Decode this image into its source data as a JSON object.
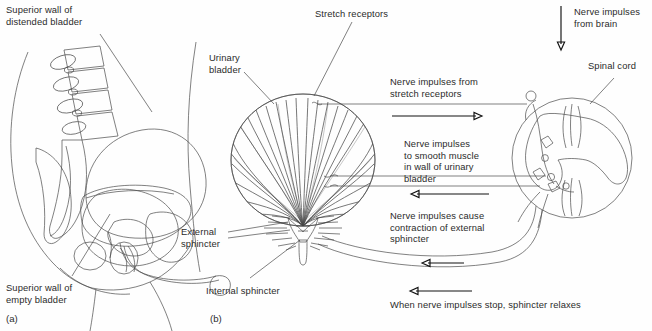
{
  "figure": {
    "background_color": "#fefefe",
    "line_color": "#4a4a4a",
    "fill_light": "#d8d8d8",
    "fill_mid": "#bdbdbd",
    "fill_dark": "#9e9e9e"
  },
  "panels": [
    {
      "tag": "(a)",
      "name": "sagittal-pelvis-view"
    },
    {
      "tag": "(b)",
      "name": "bladder-reflex-pathway-view"
    }
  ],
  "labels": {
    "superior_wall_distended": "Superior wall of\ndistended bladder",
    "superior_wall_empty": "Superior wall of\nempty bladder",
    "urinary_bladder": "Urinary\nbladder",
    "stretch_receptors": "Stretch receptors",
    "nerve_impulses_from_brain": "Nerve impulses\nfrom brain",
    "spinal_cord": "Spinal cord",
    "impulses_from_stretch_receptors": "Nerve impulses from\nstretch receptors",
    "impulses_to_smooth_muscle": "Nerve impulses\nto smooth muscle\nin wall of urinary\nbladder",
    "impulses_cause_contraction": "Nerve impulses cause\ncontraction of external\nsphincter",
    "impulses_stop_relaxes": "When nerve impulses stop, sphincter relaxes",
    "external_sphincter": "External\nsphincter",
    "internal_sphincter": "Internal sphincter"
  }
}
